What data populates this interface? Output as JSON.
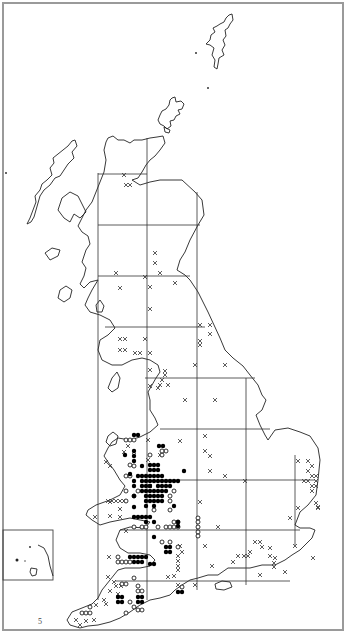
{
  "map": {
    "title": "Distribution map of Great Britain",
    "page_marker": "5",
    "legend_symbols": {
      "filled_circle": "record (recent)",
      "open_circle": "record (older)",
      "cross": "record (introduced / other)"
    },
    "colors": {
      "ink": "#000000",
      "frame": "#9a9a9a",
      "background": "#ffffff"
    },
    "frame": {
      "x": 3,
      "y": 3,
      "w": 340,
      "h": 627
    },
    "inset": {
      "x": 3,
      "y": 530,
      "w": 50,
      "h": 50
    },
    "grid": {
      "vertical": [
        {
          "x": 98,
          "y1": 173,
          "y2": 600
        },
        {
          "x": 147,
          "y1": 138,
          "y2": 600
        },
        {
          "x": 197,
          "y1": 192,
          "y2": 590
        },
        {
          "x": 246,
          "y1": 378,
          "y2": 585
        },
        {
          "x": 295,
          "y1": 455,
          "y2": 545
        }
      ],
      "horizontal": [
        {
          "y": 174,
          "x1": 98,
          "x2": 147
        },
        {
          "y": 225,
          "x1": 98,
          "x2": 200
        },
        {
          "y": 276,
          "x1": 98,
          "x2": 190
        },
        {
          "y": 327,
          "x1": 105,
          "x2": 205
        },
        {
          "y": 378,
          "x1": 145,
          "x2": 255
        },
        {
          "y": 429,
          "x1": 160,
          "x2": 270
        },
        {
          "y": 480,
          "x1": 160,
          "x2": 315
        },
        {
          "y": 530,
          "x1": 120,
          "x2": 300
        },
        {
          "y": 581,
          "x1": 115,
          "x2": 290
        }
      ]
    },
    "filled_circles": [
      [
        134,
        435
      ],
      [
        138,
        435
      ],
      [
        159,
        446
      ],
      [
        163,
        446
      ],
      [
        125,
        455
      ],
      [
        134,
        451
      ],
      [
        134,
        456
      ],
      [
        134,
        461
      ],
      [
        142,
        466
      ],
      [
        150,
        465
      ],
      [
        154,
        465
      ],
      [
        158,
        465
      ],
      [
        154,
        470
      ],
      [
        150,
        470
      ],
      [
        158,
        470
      ],
      [
        184,
        471
      ],
      [
        130,
        474
      ],
      [
        138,
        476
      ],
      [
        142,
        476
      ],
      [
        146,
        476
      ],
      [
        150,
        476
      ],
      [
        154,
        476
      ],
      [
        158,
        476
      ],
      [
        162,
        476
      ],
      [
        134,
        481
      ],
      [
        142,
        481
      ],
      [
        146,
        481
      ],
      [
        150,
        481
      ],
      [
        154,
        481
      ],
      [
        158,
        481
      ],
      [
        162,
        481
      ],
      [
        166,
        481
      ],
      [
        170,
        481
      ],
      [
        174,
        481
      ],
      [
        178,
        481
      ],
      [
        134,
        486
      ],
      [
        142,
        486
      ],
      [
        146,
        486
      ],
      [
        150,
        486
      ],
      [
        158,
        486
      ],
      [
        162,
        486
      ],
      [
        166,
        486
      ],
      [
        170,
        486
      ],
      [
        142,
        491
      ],
      [
        146,
        491
      ],
      [
        150,
        491
      ],
      [
        154,
        491
      ],
      [
        158,
        491
      ],
      [
        162,
        491
      ],
      [
        166,
        491
      ],
      [
        134,
        496
      ],
      [
        146,
        496
      ],
      [
        150,
        496
      ],
      [
        154,
        496
      ],
      [
        158,
        496
      ],
      [
        162,
        496
      ],
      [
        146,
        501
      ],
      [
        150,
        501
      ],
      [
        154,
        501
      ],
      [
        158,
        501
      ],
      [
        162,
        501
      ],
      [
        146,
        506
      ],
      [
        154,
        506
      ],
      [
        174,
        506
      ],
      [
        134,
        507
      ],
      [
        134,
        517
      ],
      [
        138,
        517
      ],
      [
        142,
        517
      ],
      [
        146,
        517
      ],
      [
        150,
        517
      ],
      [
        146,
        522
      ],
      [
        154,
        522
      ],
      [
        178,
        522
      ],
      [
        178,
        526
      ],
      [
        154,
        537
      ],
      [
        166,
        547
      ],
      [
        170,
        547
      ],
      [
        166,
        552
      ],
      [
        170,
        552
      ],
      [
        130,
        557
      ],
      [
        134,
        557
      ],
      [
        138,
        557
      ],
      [
        142,
        557
      ],
      [
        146,
        557
      ],
      [
        134,
        562
      ],
      [
        138,
        562
      ],
      [
        142,
        562
      ],
      [
        150,
        564
      ],
      [
        154,
        564
      ],
      [
        118,
        597
      ],
      [
        122,
        597
      ],
      [
        118,
        602
      ],
      [
        122,
        602
      ],
      [
        138,
        597
      ],
      [
        142,
        597
      ],
      [
        138,
        602
      ],
      [
        142,
        602
      ],
      [
        178,
        592
      ],
      [
        182,
        592
      ]
    ],
    "open_circles": [
      [
        126,
        440
      ],
      [
        130,
        440
      ],
      [
        134,
        440
      ],
      [
        162,
        455
      ],
      [
        150,
        455
      ],
      [
        166,
        451
      ],
      [
        162,
        451
      ],
      [
        130,
        465
      ],
      [
        134,
        466
      ],
      [
        126,
        476
      ],
      [
        130,
        476
      ],
      [
        126,
        491
      ],
      [
        134,
        496
      ],
      [
        170,
        496
      ],
      [
        138,
        491
      ],
      [
        174,
        491
      ],
      [
        126,
        501
      ],
      [
        170,
        501
      ],
      [
        170,
        510
      ],
      [
        154,
        510
      ],
      [
        134,
        527
      ],
      [
        142,
        527
      ],
      [
        146,
        527
      ],
      [
        158,
        527
      ],
      [
        166,
        527
      ],
      [
        170,
        527
      ],
      [
        174,
        527
      ],
      [
        178,
        527
      ],
      [
        174,
        522
      ],
      [
        178,
        522
      ],
      [
        170,
        542
      ],
      [
        162,
        542
      ],
      [
        178,
        547
      ],
      [
        118,
        557
      ],
      [
        118,
        562
      ],
      [
        122,
        562
      ],
      [
        126,
        562
      ],
      [
        130,
        562
      ],
      [
        134,
        578
      ],
      [
        138,
        586
      ],
      [
        138,
        591
      ],
      [
        142,
        591
      ],
      [
        122,
        584
      ],
      [
        126,
        584
      ],
      [
        130,
        602
      ],
      [
        134,
        607
      ],
      [
        138,
        610
      ],
      [
        142,
        610
      ],
      [
        126,
        613
      ],
      [
        82,
        613
      ],
      [
        86,
        613
      ],
      [
        90,
        613
      ],
      [
        90,
        607
      ],
      [
        182,
        587
      ],
      [
        198,
        518
      ],
      [
        198,
        522
      ],
      [
        198,
        527
      ],
      [
        198,
        532
      ],
      [
        198,
        536
      ]
    ],
    "crosses": [
      [
        124,
        175
      ],
      [
        126,
        185
      ],
      [
        130,
        185
      ],
      [
        155,
        253
      ],
      [
        155,
        263
      ],
      [
        160,
        273
      ],
      [
        116,
        273
      ],
      [
        145,
        277
      ],
      [
        150,
        287
      ],
      [
        120,
        288
      ],
      [
        175,
        283
      ],
      [
        150,
        309
      ],
      [
        200,
        325
      ],
      [
        210,
        325
      ],
      [
        210,
        334
      ],
      [
        200,
        341
      ],
      [
        200,
        345
      ],
      [
        195,
        365
      ],
      [
        225,
        365
      ],
      [
        120,
        339
      ],
      [
        125,
        339
      ],
      [
        145,
        339
      ],
      [
        125,
        350
      ],
      [
        140,
        353
      ],
      [
        150,
        353
      ],
      [
        135,
        353
      ],
      [
        120,
        350
      ],
      [
        150,
        370
      ],
      [
        165,
        371
      ],
      [
        165,
        375
      ],
      [
        162,
        380
      ],
      [
        160,
        385
      ],
      [
        168,
        385
      ],
      [
        158,
        388
      ],
      [
        185,
        400
      ],
      [
        215,
        400
      ],
      [
        150,
        386
      ],
      [
        205,
        436
      ],
      [
        180,
        441
      ],
      [
        205,
        451
      ],
      [
        210,
        456
      ],
      [
        210,
        471
      ],
      [
        225,
        476
      ],
      [
        245,
        481
      ],
      [
        298,
        461
      ],
      [
        308,
        461
      ],
      [
        312,
        466
      ],
      [
        308,
        471
      ],
      [
        312,
        476
      ],
      [
        316,
        476
      ],
      [
        304,
        481
      ],
      [
        308,
        481
      ],
      [
        316,
        481
      ],
      [
        312,
        486
      ],
      [
        316,
        486
      ],
      [
        312,
        491
      ],
      [
        316,
        503
      ],
      [
        318,
        507
      ],
      [
        298,
        508
      ],
      [
        290,
        518
      ],
      [
        318,
        508
      ],
      [
        200,
        502
      ],
      [
        108,
        501
      ],
      [
        112,
        501
      ],
      [
        116,
        501
      ],
      [
        120,
        501
      ],
      [
        124,
        501
      ],
      [
        110,
        502
      ],
      [
        120,
        509
      ],
      [
        95,
        517
      ],
      [
        110,
        516
      ],
      [
        120,
        517
      ],
      [
        148,
        440
      ],
      [
        148,
        460
      ],
      [
        160,
        455
      ],
      [
        110,
        466
      ],
      [
        106,
        462
      ],
      [
        128,
        446
      ],
      [
        124,
        452
      ],
      [
        134,
        452
      ],
      [
        126,
        531
      ],
      [
        150,
        486
      ],
      [
        205,
        546
      ],
      [
        218,
        527
      ],
      [
        255,
        542
      ],
      [
        260,
        542
      ],
      [
        262,
        547
      ],
      [
        250,
        552
      ],
      [
        248,
        556
      ],
      [
        244,
        556
      ],
      [
        270,
        548
      ],
      [
        270,
        556
      ],
      [
        274,
        563
      ],
      [
        274,
        567
      ],
      [
        238,
        556
      ],
      [
        275,
        558
      ],
      [
        260,
        575
      ],
      [
        285,
        572
      ],
      [
        212,
        566
      ],
      [
        233,
        562
      ],
      [
        313,
        558
      ],
      [
        295,
        546
      ],
      [
        180,
        546
      ],
      [
        182,
        552
      ],
      [
        178,
        556
      ],
      [
        178,
        561
      ],
      [
        178,
        566
      ],
      [
        178,
        570
      ],
      [
        174,
        576
      ],
      [
        168,
        577
      ],
      [
        178,
        585
      ],
      [
        195,
        585
      ],
      [
        109,
        557
      ],
      [
        108,
        577
      ],
      [
        116,
        586
      ],
      [
        110,
        591
      ],
      [
        118,
        594
      ],
      [
        104,
        600
      ],
      [
        106,
        604
      ],
      [
        76,
        620
      ],
      [
        80,
        625
      ],
      [
        86,
        621
      ],
      [
        94,
        620
      ],
      [
        96,
        605
      ],
      [
        114,
        582
      ],
      [
        121,
        586
      ]
    ]
  }
}
